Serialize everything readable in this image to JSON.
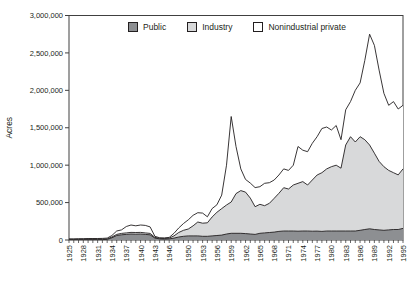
{
  "figure_title": "",
  "axis": {
    "ylabel": "Acres",
    "yticks": [
      "0",
      "500,000",
      "1,000,000",
      "1,500,000",
      "2,000,000",
      "2,500,000",
      "3,000,000"
    ]
  },
  "chart_data": {
    "type": "area",
    "stacked": true,
    "title": "",
    "xlabel": "",
    "ylabel": "Acres",
    "ylim": [
      0,
      3000000
    ],
    "grid": false,
    "legend_position": "top-center-inside",
    "axis_color": "#404040",
    "outline_color": "#231f20",
    "x": [
      1925,
      1926,
      1927,
      1928,
      1929,
      1930,
      1931,
      1932,
      1933,
      1934,
      1935,
      1936,
      1937,
      1938,
      1939,
      1940,
      1941,
      1942,
      1943,
      1944,
      1945,
      1946,
      1947,
      1948,
      1949,
      1950,
      1951,
      1952,
      1953,
      1954,
      1955,
      1956,
      1957,
      1958,
      1959,
      1960,
      1961,
      1962,
      1963,
      1964,
      1965,
      1966,
      1967,
      1968,
      1969,
      1970,
      1971,
      1972,
      1973,
      1974,
      1975,
      1976,
      1977,
      1978,
      1979,
      1980,
      1981,
      1982,
      1983,
      1984,
      1985,
      1986,
      1987,
      1988,
      1989,
      1990,
      1991,
      1992,
      1993,
      1994,
      1995
    ],
    "xtick_labels": [
      "1925",
      "1928",
      "1931",
      "1934",
      "1937",
      "1940",
      "1943",
      "1946",
      "1950",
      "1953",
      "1956",
      "1959",
      "1962",
      "1965",
      "1968",
      "1971",
      "1974",
      "1977",
      "1980",
      "1983",
      "1986",
      "1989",
      "1992",
      "1995"
    ],
    "yticks": [
      "0",
      "500,000",
      "1,000,000",
      "1,500,000",
      "2,000,000",
      "2,500,000",
      "3,000,000"
    ],
    "series": [
      {
        "name": "Public",
        "color": "#8d8f92",
        "values": [
          5000,
          5000,
          5000,
          6000,
          6000,
          6000,
          6000,
          6000,
          8000,
          30000,
          60000,
          70000,
          75000,
          80000,
          78000,
          80000,
          75000,
          70000,
          25000,
          15000,
          12000,
          15000,
          25000,
          40000,
          50000,
          55000,
          55000,
          55000,
          50000,
          50000,
          55000,
          60000,
          65000,
          80000,
          90000,
          90000,
          90000,
          85000,
          80000,
          75000,
          90000,
          95000,
          100000,
          105000,
          115000,
          120000,
          120000,
          120000,
          118000,
          120000,
          120000,
          117000,
          119000,
          115000,
          120000,
          120000,
          120000,
          120000,
          120000,
          120000,
          120000,
          130000,
          140000,
          150000,
          140000,
          135000,
          130000,
          135000,
          140000,
          140000,
          155000
        ]
      },
      {
        "name": "Industry",
        "color": "#d8d9da",
        "values": [
          5000,
          5000,
          5000,
          5000,
          6000,
          6000,
          6000,
          6000,
          7000,
          10000,
          15000,
          18000,
          20000,
          22000,
          22000,
          22000,
          20000,
          18000,
          10000,
          8000,
          8000,
          10000,
          30000,
          60000,
          80000,
          92000,
          135000,
          185000,
          175000,
          180000,
          252000,
          310000,
          355000,
          388000,
          418000,
          530000,
          570000,
          555000,
          480000,
          370000,
          387000,
          363000,
          390000,
          452000,
          509000,
          579000,
          561000,
          615000,
          640000,
          660000,
          615000,
          685000,
          750000,
          785000,
          830000,
          860000,
          880000,
          840000,
          1150000,
          1260000,
          1190000,
          1250000,
          1200000,
          1120000,
          1020000,
          915000,
          850000,
          795000,
          760000,
          730000,
          795000
        ]
      },
      {
        "name": "Nonindustrial private",
        "color": "#ffffff",
        "values": [
          5000,
          5000,
          8000,
          7000,
          8000,
          8000,
          8000,
          10000,
          10000,
          20000,
          45000,
          47000,
          85000,
          98000,
          90000,
          98000,
          100000,
          87000,
          15000,
          7000,
          8000,
          10000,
          35000,
          60000,
          90000,
          123000,
          140000,
          125000,
          135000,
          80000,
          113000,
          100000,
          180000,
          532000,
          1142000,
          630000,
          290000,
          170000,
          200000,
          255000,
          235000,
          300000,
          276000,
          245000,
          245000,
          251000,
          249000,
          265000,
          492000,
          420000,
          445000,
          490000,
          512000,
          590000,
          560000,
          490000,
          530000,
          380000,
          470000,
          470000,
          690000,
          720000,
          1060000,
          1480000,
          1440000,
          1220000,
          980000,
          870000,
          950000,
          880000,
          850000
        ]
      }
    ]
  }
}
